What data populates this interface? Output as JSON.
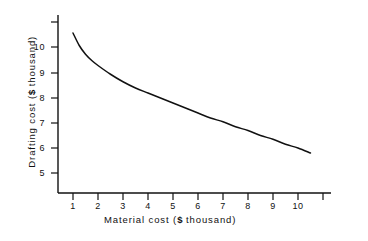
{
  "chart_data": {
    "type": "line",
    "title": "",
    "xlabel_parts": {
      "prefix": "Material cost (",
      "currency": "$",
      "suffix": " thousand)"
    },
    "ylabel_parts": {
      "prefix": "Drafting cost (",
      "currency": "$",
      "suffix": " thousand)"
    },
    "xlabel": "Material cost ( $ thousand)",
    "ylabel": "Drafting cost ( $ thousand)",
    "xticks": [
      1,
      2,
      3,
      4,
      5,
      6,
      7,
      8,
      9,
      10
    ],
    "xtick_labels": [
      "1",
      "2",
      "3",
      "4",
      "5",
      "6",
      "7",
      "8",
      "9",
      "10"
    ],
    "yticks": [
      5,
      6,
      7,
      8,
      9,
      10
    ],
    "ytick_labels": [
      "5",
      "6",
      "7",
      "8",
      "9",
      "10"
    ],
    "xlim": [
      0.2,
      11.3
    ],
    "ylim": [
      4.2,
      11.2
    ],
    "grid": false,
    "legend": null,
    "line_color": "#111111",
    "axis_color": "#111111",
    "background_color": "#ffffff",
    "series": [
      {
        "name": "Drafting cost",
        "x": [
          1.0,
          1.25,
          1.5,
          1.75,
          2.0,
          2.5,
          3.0,
          3.5,
          4.0,
          4.5,
          5.0,
          5.5,
          6.0,
          6.5,
          7.0,
          7.5,
          8.0,
          8.5,
          9.0,
          9.5,
          10.0,
          10.5
        ],
        "y": [
          10.6,
          10.1,
          9.75,
          9.5,
          9.3,
          8.95,
          8.65,
          8.4,
          8.2,
          8.0,
          7.8,
          7.6,
          7.4,
          7.2,
          7.05,
          6.85,
          6.7,
          6.5,
          6.35,
          6.15,
          6.0,
          5.8
        ]
      }
    ],
    "annotations": []
  }
}
